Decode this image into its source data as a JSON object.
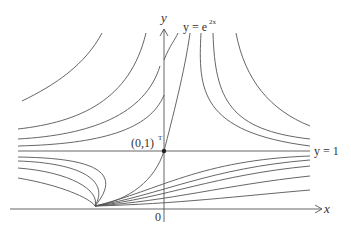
{
  "diagram": {
    "type": "phase-portrait",
    "axes": {
      "x_label": "x",
      "y_label": "y",
      "origin_label": "0"
    },
    "equilibrium": {
      "label": "(0,1)",
      "superscript": "T"
    },
    "curves": {
      "exp_label_lhs": "y = e",
      "exp_label_exp": "2x",
      "horizontal_label": "y = 1"
    },
    "colors": {
      "line": "#555555",
      "text": "#333333",
      "point": "#222222"
    }
  }
}
